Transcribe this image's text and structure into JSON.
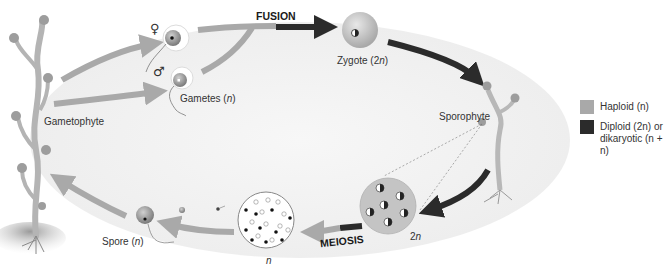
{
  "diagram": {
    "type": "life-cycle",
    "colors": {
      "haploid": "#a9a9a9",
      "diploid": "#2b2b2b",
      "ellipse_fill": "#f4f4f4",
      "cell_fill": "#bdbdbd"
    },
    "stages": {
      "gametophyte": "Gametophyte",
      "gametes_prefix": "Gametes (",
      "gametes_ploidy": "n",
      "gametes_suffix": ")",
      "female_symbol": "♀",
      "male_symbol": "♂",
      "fusion": "FUSION",
      "zygote_prefix": "Zygote (2",
      "zygote_ploidy": "n",
      "zygote_suffix": ")",
      "sporophyte": "Sporophyte",
      "diploid_cell_prefix": "2",
      "diploid_cell_ploidy": "n",
      "meiosis": "MEIOSIS",
      "haploid_cells_ploidy": "n",
      "spore_prefix": "Spore (",
      "spore_ploidy": "n",
      "spore_suffix": ")"
    }
  },
  "legend": {
    "items": [
      {
        "label": "Haploid (n)",
        "color": "#a9a9a9"
      },
      {
        "label_line1": "Diploid (2n) or",
        "label_line2": "dikaryotic (n + n)",
        "color": "#2b2b2b"
      }
    ]
  }
}
